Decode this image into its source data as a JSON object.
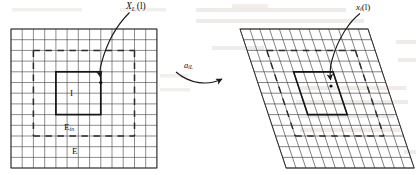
{
  "figure": {
    "type": "lattice-transformation-diagram",
    "ink_color": "#1a1a1a",
    "grid_color": "#3a3a3a",
    "bleed_color": "#d8d3cc",
    "background": "#ffffff"
  },
  "labels": {
    "left_arrow_label": "X",
    "left_arrow_sub": "L",
    "left_arrow_arg": "(l)",
    "right_arrow_label": "x",
    "right_arrow_sub": "i",
    "right_arrow_arg": "(l)",
    "map_label": "a",
    "map_sub": "iL",
    "region_inner": "I",
    "region_middle": "E",
    "region_middle_sub": "in",
    "region_outer": "E"
  },
  "left_panel": {
    "name": "square-lattice",
    "x": 11,
    "y": 29,
    "width": 146,
    "height": 139,
    "cols": 13,
    "rows": 13,
    "inner_box": {
      "col0": 4,
      "row0": 4,
      "col1": 9,
      "row1": 9
    },
    "dashed_box": {
      "col0": 2,
      "row0": 2,
      "col1": 11,
      "row1": 11
    }
  },
  "right_panel": {
    "name": "sheared-lattice",
    "x": 240,
    "y": 29,
    "width": 170,
    "height": 139,
    "cols": 13,
    "rows": 13,
    "shear_dx": 46,
    "inner_box": {
      "col0": 4,
      "row0": 4,
      "col1": 9,
      "row1": 9
    },
    "dashed_box": {
      "col0": 2,
      "row0": 2,
      "col1": 11,
      "row1": 11
    }
  },
  "bleed_text": {
    "line1": "there is a   is the volume of the structure",
    "line2": "of E over the ideal of every deformed lattice",
    "line3": "the lim",
    "line4": "to interval",
    "line5": "make n",
    "line6": "system E"
  }
}
